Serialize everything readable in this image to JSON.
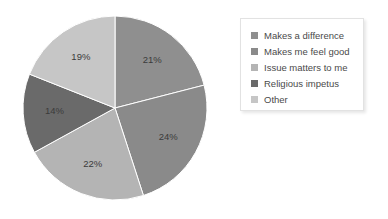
{
  "background_color": "#ffffff",
  "chart_data": {
    "type": "pie",
    "title": "",
    "subtitle": "",
    "xlabel": "",
    "ylabel": "",
    "grid": false,
    "start_angle_deg": 0,
    "direction": "clockwise",
    "legend_position": "right",
    "categories": [
      "Makes a difference",
      "Makes me feel good",
      "Issue matters to me",
      "Religious impetus",
      "Other"
    ],
    "values": [
      21,
      24,
      22,
      14,
      19
    ],
    "value_labels": [
      "21%",
      "24%",
      "22%",
      "14%",
      "19%"
    ],
    "colors": [
      "#8f8f8f",
      "#8a8a8a",
      "#b4b4b4",
      "#6a6a6a",
      "#c6c6c6"
    ],
    "slices": [
      {
        "label": "Makes a difference",
        "value": 21,
        "display": "21%",
        "color": "#8f8f8f"
      },
      {
        "label": "Makes me feel good",
        "value": 24,
        "display": "24%",
        "color": "#8a8a8a"
      },
      {
        "label": "Issue matters to me",
        "value": 22,
        "display": "22%",
        "color": "#b4b4b4"
      },
      {
        "label": "Religious impetus",
        "value": 14,
        "display": "14%",
        "color": "#6a6a6a"
      },
      {
        "label": "Other",
        "value": 19,
        "display": "19%",
        "color": "#c6c6c6"
      }
    ]
  },
  "legend": {
    "items": [
      {
        "label": "Makes a difference",
        "color": "#8f8f8f"
      },
      {
        "label": "Makes me feel good",
        "color": "#8a8a8a"
      },
      {
        "label": "Issue matters to me",
        "color": "#b4b4b4"
      },
      {
        "label": "Religious impetus",
        "color": "#6a6a6a"
      },
      {
        "label": "Other",
        "color": "#c6c6c6"
      }
    ]
  },
  "labels": {
    "slice_0": "21%",
    "slice_1": "24%",
    "slice_2": "22%",
    "slice_3": "14%",
    "slice_4": "19%"
  }
}
